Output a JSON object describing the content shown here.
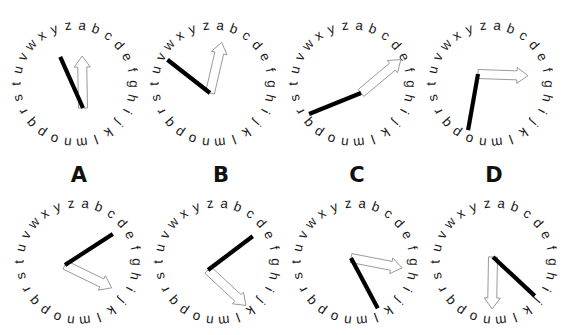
{
  "figure": {
    "background_color": "#ffffff",
    "width": 568,
    "height": 335
  },
  "ring": {
    "letters": [
      "a",
      "b",
      "c",
      "d",
      "e",
      "f",
      "g",
      "h",
      "i",
      "j",
      "k",
      "l",
      "m",
      "n",
      "o",
      "p",
      "q",
      "r",
      "s",
      "t",
      "u",
      "v",
      "w",
      "x",
      "y",
      "z"
    ],
    "letter_count": 26,
    "start_angle_deg": 7,
    "letter_color": "#1a1a1a",
    "letter_font_size": 13.5,
    "radius": 58
  },
  "hands": {
    "black_hand_color": "#000000",
    "white_hand_fill": "#ffffff",
    "white_hand_stroke": "#9a9a9a",
    "black_hand_width": 4.2,
    "white_hand_width": 9.0
  },
  "choice_labels": [
    {
      "text": "A",
      "x": 79,
      "y": 2
    },
    {
      "text": "B",
      "x": 221,
      "y": 2
    },
    {
      "text": "C",
      "x": 357,
      "y": 2
    },
    {
      "text": "D",
      "x": 494,
      "y": 2
    }
  ],
  "top_row": {
    "name": "stimulus-row",
    "clocks": [
      {
        "id": "stimulus-1",
        "cx": 75,
        "cy": 84,
        "radius": 58,
        "pivot": {
          "x": 8,
          "y": 24
        },
        "black_hand": {
          "angle_deg": 336,
          "length": 56,
          "target_letter": "x"
        },
        "white_hand": {
          "angle_deg": 359,
          "length": 52,
          "target_letter": "z"
        }
      },
      {
        "id": "stimulus-2",
        "cx": 213,
        "cy": 84,
        "radius": 58,
        "pivot": {
          "x": -3,
          "y": 9
        },
        "black_hand": {
          "angle_deg": 308,
          "length": 54,
          "target_letter": "w"
        },
        "white_hand": {
          "angle_deg": 13,
          "length": 52,
          "target_letter": "a"
        }
      },
      {
        "id": "stimulus-3",
        "cx": 352,
        "cy": 84,
        "radius": 58,
        "pivot": {
          "x": 9,
          "y": 9
        },
        "black_hand": {
          "angle_deg": 248,
          "length": 56,
          "target_letter": "t"
        },
        "white_hand": {
          "angle_deg": 50,
          "length": 52,
          "target_letter": "c"
        }
      },
      {
        "id": "stimulus-4",
        "cx": 490,
        "cy": 84,
        "radius": 58,
        "pivot": {
          "x": -12,
          "y": -10
        },
        "black_hand": {
          "angle_deg": 190,
          "length": 57,
          "target_letter": "m"
        },
        "white_hand": {
          "angle_deg": 92,
          "length": 50,
          "target_letter": "g"
        }
      }
    ]
  },
  "bottom_row": {
    "name": "options-row",
    "clocks": [
      {
        "id": "option-A",
        "label": "A",
        "cx": 78,
        "cy": 72,
        "radius": 58,
        "pivot": {
          "x": -13,
          "y": 3
        },
        "black_hand": {
          "angle_deg": 57,
          "length": 57,
          "target_letter": "e"
        },
        "white_hand": {
          "angle_deg": 116,
          "length": 52,
          "target_letter": "i"
        }
      },
      {
        "id": "option-B",
        "label": "B",
        "cx": 217,
        "cy": 72,
        "radius": 58,
        "pivot": {
          "x": -9,
          "y": 8
        },
        "black_hand": {
          "angle_deg": 53,
          "length": 56,
          "target_letter": "d"
        },
        "white_hand": {
          "angle_deg": 133,
          "length": 52,
          "target_letter": "k"
        }
      },
      {
        "id": "option-C",
        "label": "C",
        "cx": 355,
        "cy": 72,
        "radius": 58,
        "pivot": {
          "x": -4,
          "y": -4
        },
        "black_hand": {
          "angle_deg": 152,
          "length": 57,
          "target_letter": "m"
        },
        "white_hand": {
          "angle_deg": 101,
          "length": 52,
          "target_letter": "i"
        }
      },
      {
        "id": "option-D",
        "label": "D",
        "cx": 494,
        "cy": 72,
        "radius": 58,
        "pivot": {
          "x": -1,
          "y": -5
        },
        "black_hand": {
          "angle_deg": 133,
          "length": 57,
          "target_letter": "k"
        },
        "white_hand": {
          "angle_deg": 181,
          "length": 52,
          "target_letter": "n"
        }
      }
    ]
  }
}
